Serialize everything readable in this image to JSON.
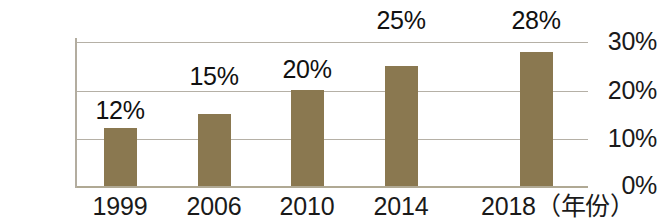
{
  "chart_data": {
    "type": "bar",
    "title": "",
    "subtitle": "",
    "xlabel": "年份",
    "ylabel": "",
    "categories": [
      "1999",
      "2006",
      "2010",
      "2014",
      "2018"
    ],
    "values": [
      12,
      15,
      20,
      25,
      28
    ],
    "value_labels": [
      "12%",
      "15%",
      "20%",
      "25%",
      "28%"
    ],
    "ylim": [
      0,
      30
    ],
    "y_ticks": [
      0,
      10,
      20,
      30
    ],
    "y_tick_labels": [
      "0%",
      "10%",
      "20%",
      "30%"
    ],
    "grid": true,
    "legend": "none",
    "series": [
      {
        "name": "",
        "values": [
          12,
          15,
          20,
          25,
          28
        ],
        "color": "#8a7850"
      }
    ],
    "colors": {
      "bar": "#8a7850",
      "gridline": "#b5b0a6",
      "axis": "#b3ada0",
      "text": "#1a1a1a",
      "background": "#ffffff"
    }
  },
  "axis": {
    "x_tick_labels": [
      "1999",
      "2006",
      "2010",
      "2014",
      "2018"
    ],
    "x_unit_suffix": "（年份）",
    "x_last_label_full": "2018（年份）"
  }
}
